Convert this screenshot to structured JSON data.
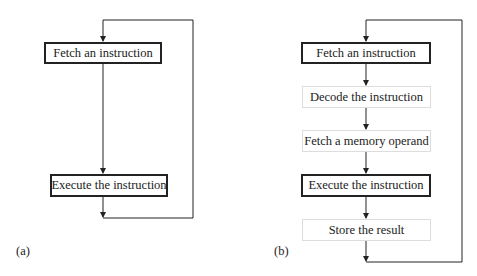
{
  "diagram_a": {
    "label": "(a)",
    "steps": [
      {
        "text": "Fetch an instruction",
        "style": "bold"
      },
      {
        "text": "Execute the instruction",
        "style": "bold"
      }
    ]
  },
  "diagram_b": {
    "label": "(b)",
    "steps": [
      {
        "text": "Fetch an instruction",
        "style": "bold"
      },
      {
        "text": "Decode the instruction",
        "style": "light"
      },
      {
        "text": "Fetch a memory operand",
        "style": "light"
      },
      {
        "text": "Execute the instruction",
        "style": "bold"
      },
      {
        "text": "Store the result",
        "style": "light"
      }
    ]
  },
  "colors": {
    "line": "#222222",
    "light_border": "#dddddd"
  }
}
